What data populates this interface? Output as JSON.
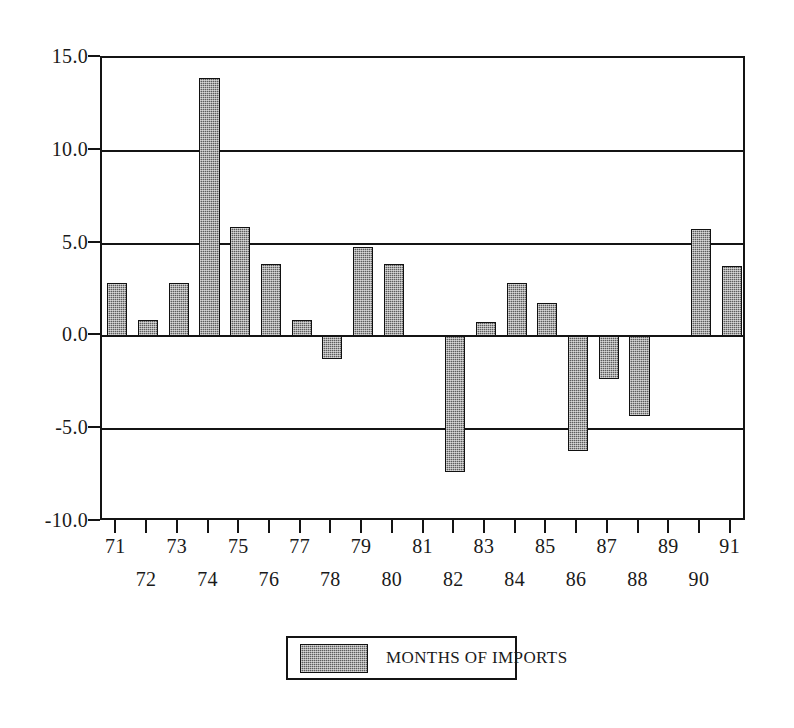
{
  "chart_data": {
    "type": "bar",
    "title": "",
    "subtitle": "",
    "xlabel": "",
    "ylabel": "",
    "categories": [
      "71",
      "72",
      "73",
      "74",
      "75",
      "76",
      "77",
      "78",
      "79",
      "80",
      "81",
      "82",
      "83",
      "84",
      "85",
      "86",
      "87",
      "88",
      "89",
      "90",
      "91"
    ],
    "values": [
      2.9,
      0.9,
      2.9,
      13.9,
      5.9,
      3.9,
      0.9,
      -1.2,
      4.8,
      3.9,
      0.0,
      -7.3,
      0.8,
      2.9,
      1.8,
      -6.2,
      -2.3,
      -4.3,
      0.0,
      5.8,
      3.8
    ],
    "series": [
      {
        "name": "MONTHS OF IMPORTS",
        "values": [
          2.9,
          0.9,
          2.9,
          13.9,
          5.9,
          3.9,
          0.9,
          -1.2,
          4.8,
          3.9,
          0.0,
          -7.3,
          0.8,
          2.9,
          1.8,
          -6.2,
          -2.3,
          -4.3,
          0.0,
          5.8,
          3.8
        ]
      }
    ],
    "ylim": [
      -10.0,
      15.0
    ],
    "ytick_labels": [
      "15.0",
      "10.0",
      "5.0",
      "0.0",
      "-5.0",
      "-10.0"
    ],
    "ytick_values": [
      15.0,
      10.0,
      5.0,
      0.0,
      -5.0,
      -10.0
    ],
    "grid": true,
    "legend_position": "bottom-center",
    "bar_color": "#5d5d5d",
    "axis_color": "#141414"
  },
  "legend": {
    "entries": [
      {
        "label": "MONTHS OF IMPORTS",
        "swatch_color": "#5d5d5d"
      }
    ]
  },
  "axis": {
    "y_labels": [
      "15.0",
      "10.0",
      "5.0",
      "0.0",
      "-5.0",
      "-10.0"
    ],
    "x_labels_top_row": [
      "71",
      "73",
      "75",
      "77",
      "79",
      "81",
      "83",
      "85",
      "87",
      "89",
      "91"
    ],
    "x_labels_bottom_row": [
      "72",
      "74",
      "76",
      "78",
      "80",
      "82",
      "84",
      "86",
      "88",
      "90"
    ]
  }
}
